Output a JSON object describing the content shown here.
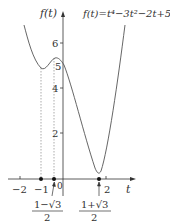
{
  "chart_data": {
    "type": "line",
    "title": "f(t)=t⁴−3t²−2t+5",
    "xlabel": "t",
    "ylabel": "f(t)",
    "function": "t^4 - 3t^2 - 2t + 5",
    "x_ticks": [
      {
        "label": "−2",
        "value": -2
      },
      {
        "label": "−1",
        "value": -1
      },
      {
        "label": "0",
        "value": 0
      },
      {
        "label": "2",
        "value": 2
      }
    ],
    "y_ticks": [
      {
        "label": "6",
        "value": 6
      },
      {
        "label": "5",
        "value": 5
      },
      {
        "label": "4",
        "value": 4
      },
      {
        "label": "2",
        "value": 2
      }
    ],
    "critical_points": [
      {
        "t": -1,
        "f": 5,
        "label": "−1"
      },
      {
        "t": -0.366,
        "f": 5.35,
        "label_num": "1−√3",
        "label_den": "2"
      },
      {
        "t": 1.366,
        "f": 0.15,
        "label_num": "1+√3",
        "label_den": "2"
      }
    ],
    "series": [
      {
        "name": "f(t)",
        "x": [
          -1.6,
          -1.5,
          -1.25,
          -1,
          -0.75,
          -0.5,
          -0.366,
          -0.25,
          0,
          0.25,
          0.5,
          0.75,
          1,
          1.25,
          1.366,
          1.5,
          1.75,
          2,
          2.3
        ],
        "values": [
          7.07,
          6.31,
          5.25,
          5.0,
          5.13,
          5.31,
          5.35,
          5.31,
          5.0,
          4.31,
          3.31,
          2.13,
          1.0,
          0.25,
          0.15,
          0.31,
          1.69,
          5.0,
          7.0
        ]
      }
    ],
    "curve_path_px": "M24,25 C28,40 33,60 41,68 C46,72 50,60 55,58 C58,57 61,60 64,65 C72,85 84,135 95,168 C97,173 99,175 101,171 C108,150 118,80 125,25",
    "grid": false,
    "legend": "none"
  },
  "labels": {
    "y_axis": "f(t)",
    "x_axis": "t",
    "formula": "f(t)=t⁴−3t²−2t+5",
    "origin": "0",
    "frac_left_num": "1−√3",
    "frac_left_den": "2",
    "frac_right_num": "1+√3",
    "frac_right_den": "2"
  },
  "colors": {
    "axis": "#333333",
    "curve": "#555555",
    "dashed": "#888888",
    "dot": "#111111"
  }
}
